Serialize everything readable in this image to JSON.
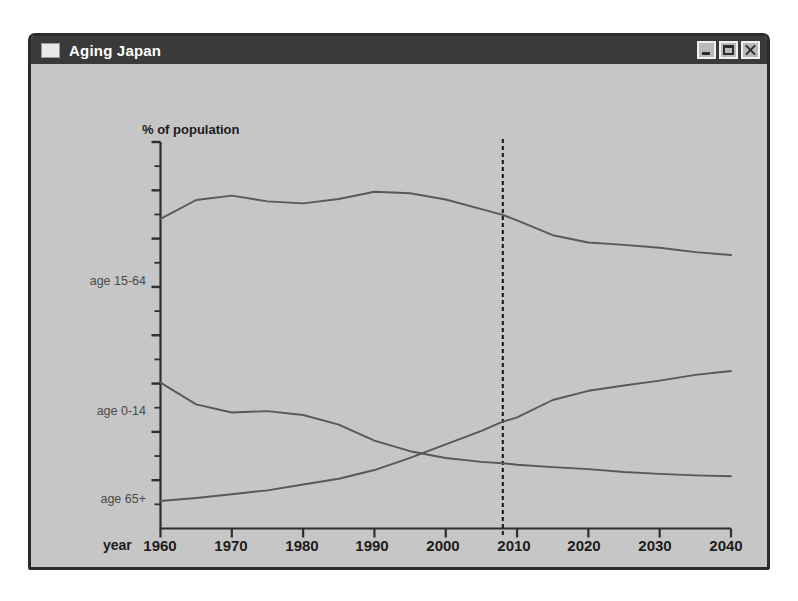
{
  "window": {
    "title": "Aging Japan",
    "icon": "window-icon",
    "buttons": [
      {
        "name": "minimize-button",
        "label": "Minimize"
      },
      {
        "name": "maximize-button",
        "label": "Maximize"
      },
      {
        "name": "close-button",
        "label": "Close"
      }
    ]
  },
  "chart_data": {
    "type": "line",
    "title": "",
    "ylabel": "% of population",
    "xlabel": "year",
    "xlim": [
      1960,
      2040
    ],
    "ylim": [
      0,
      80
    ],
    "grid": false,
    "legend_position": "inline-left",
    "xticks": [
      "1960",
      "1970",
      "1980",
      "1990",
      "2000",
      "2010",
      "2020",
      "2030",
      "2040"
    ],
    "x": [
      1960,
      1965,
      1970,
      1975,
      1980,
      1985,
      1990,
      1995,
      2000,
      2005,
      2008,
      2010,
      2015,
      2020,
      2025,
      2030,
      2035,
      2040
    ],
    "series": [
      {
        "name": "age 15-64",
        "label": "age 15-64",
        "values": [
          64.1,
          68.0,
          68.9,
          67.7,
          67.3,
          68.2,
          69.7,
          69.4,
          68.1,
          66.1,
          64.9,
          63.8,
          60.7,
          59.2,
          58.7,
          58.1,
          57.2,
          56.6
        ]
      },
      {
        "name": "age 0-14",
        "label": "age 0-14",
        "values": [
          30.2,
          25.7,
          24.0,
          24.3,
          23.5,
          21.5,
          18.2,
          16.0,
          14.6,
          13.8,
          13.5,
          13.2,
          12.7,
          12.3,
          11.7,
          11.3,
          11.0,
          10.8
        ]
      },
      {
        "name": "age 65+",
        "label": "age 65+",
        "values": [
          5.7,
          6.3,
          7.1,
          7.9,
          9.1,
          10.3,
          12.1,
          14.6,
          17.4,
          20.2,
          22.1,
          23.0,
          26.6,
          28.5,
          29.6,
          30.6,
          31.8,
          32.6
        ]
      }
    ],
    "annotations": [
      {
        "name": "present-year-marker",
        "type": "vertical-dashed-line",
        "x": 2008
      }
    ]
  }
}
